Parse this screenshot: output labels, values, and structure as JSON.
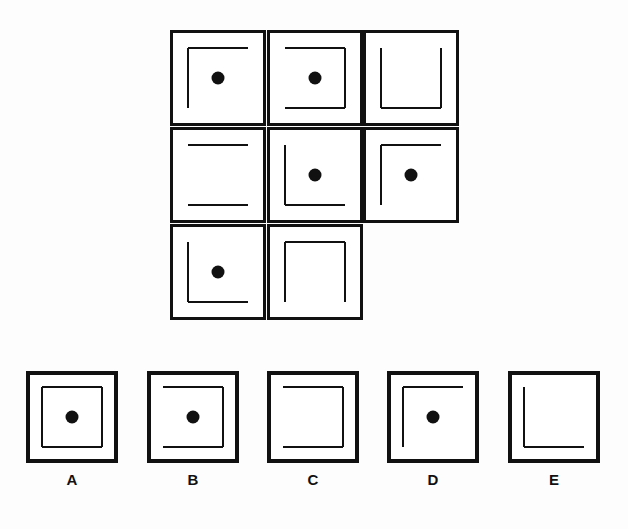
{
  "puzzle": {
    "type": "matrix-reasoning",
    "grid": {
      "rows": 3,
      "cols": 3,
      "cells": [
        {
          "row": 0,
          "col": 0,
          "sides": [
            "top",
            "left"
          ],
          "dot": true
        },
        {
          "row": 0,
          "col": 1,
          "sides": [
            "top",
            "right",
            "bottom"
          ],
          "dot": true
        },
        {
          "row": 0,
          "col": 2,
          "sides": [
            "left",
            "right",
            "bottom"
          ],
          "dot": false
        },
        {
          "row": 1,
          "col": 0,
          "sides": [
            "top",
            "bottom"
          ],
          "dot": false
        },
        {
          "row": 1,
          "col": 1,
          "sides": [
            "left",
            "bottom"
          ],
          "dot": true
        },
        {
          "row": 1,
          "col": 2,
          "sides": [
            "top",
            "left"
          ],
          "dot": true
        },
        {
          "row": 2,
          "col": 0,
          "sides": [
            "left",
            "bottom"
          ],
          "dot": true
        },
        {
          "row": 2,
          "col": 1,
          "sides": [
            "top",
            "left",
            "right"
          ],
          "dot": false
        },
        {
          "row": 2,
          "col": 2,
          "missing": true
        }
      ]
    },
    "options": [
      {
        "label": "A",
        "sides": [
          "top",
          "left",
          "right",
          "bottom"
        ],
        "dot": true
      },
      {
        "label": "B",
        "sides": [
          "top",
          "right",
          "bottom"
        ],
        "dot": true
      },
      {
        "label": "C",
        "sides": [
          "top",
          "right",
          "bottom"
        ],
        "dot": false
      },
      {
        "label": "D",
        "sides": [
          "top",
          "left"
        ],
        "dot": true
      },
      {
        "label": "E",
        "sides": [
          "left",
          "bottom"
        ],
        "dot": false
      }
    ]
  }
}
